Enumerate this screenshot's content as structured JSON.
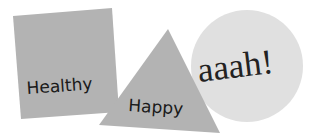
{
  "shapes": {
    "square": {
      "label": "Healthy",
      "color": "#b3b3b3"
    },
    "triangle": {
      "label": "Happy",
      "color": "#b3b3b3"
    },
    "circle": {
      "label": "aaah!",
      "color": "#e0e0e0"
    }
  },
  "colors": {
    "background": "#ffffff",
    "text": "#1a1a1a"
  }
}
